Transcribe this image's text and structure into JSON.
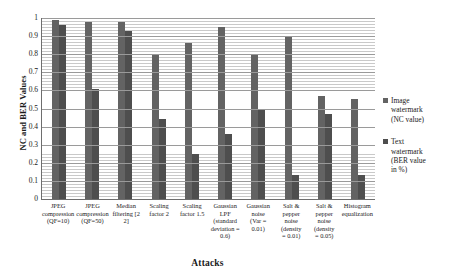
{
  "chart_data": {
    "type": "bar",
    "title": "",
    "xlabel": "Attacks",
    "ylabel": "NC and BER Values",
    "ylim": [
      0,
      1
    ],
    "yticks": [
      "0",
      "0.1",
      "0.2",
      "0.3",
      "0.4",
      "0.5",
      "0.6",
      "0.7",
      "0.8",
      "0.9",
      "1"
    ],
    "grid": true,
    "legend_position": "right",
    "categories": [
      "JPEG compression (QF=10)",
      "JPEG compression (QF=50)",
      "Median filtering [2 2]",
      "Scaling factor 2",
      "Scaling factor 1.5",
      "Gaussian LPF (standard deviation = 0.6)",
      "Gaussian noise (Var = 0.01)",
      "Salt & pepper noise (density = 0.01)",
      "Salt & pepper noise (density = 0.05)",
      "Histogram equalization"
    ],
    "category_lines": [
      [
        "JPEG",
        "compression",
        "(QF=10)"
      ],
      [
        "JPEG",
        "compression",
        "(QF=50)"
      ],
      [
        "Median",
        "filtering [2",
        "2]"
      ],
      [
        "Scaling",
        "factor 2"
      ],
      [
        "Scaling",
        "factor 1.5"
      ],
      [
        "Gaussian",
        "LPF",
        "(standard",
        "deviation =",
        "0.6)"
      ],
      [
        "Gaussian",
        "noise",
        "(Var =",
        "0.01)"
      ],
      [
        "Salt &",
        "pepper",
        "noise",
        "(density",
        "= 0.01)"
      ],
      [
        "Salt &",
        "pepper",
        "noise",
        "(density",
        "= 0.05)"
      ],
      [
        "Histogram",
        "equalization"
      ]
    ],
    "series": [
      {
        "name": "Image watermark (NC value)",
        "name_lines": [
          "Image",
          "watermark",
          "(NC value)"
        ],
        "color": "#636363",
        "values": [
          0.99,
          0.98,
          0.98,
          0.8,
          0.86,
          0.95,
          0.8,
          0.9,
          0.57,
          0.55
        ]
      },
      {
        "name": "Text watermark (BER value in %)",
        "name_lines": [
          "Text",
          "watermark",
          "(BER value",
          "in %)"
        ],
        "color": "#4e4e4e",
        "values": [
          0.96,
          0.61,
          0.93,
          0.44,
          0.25,
          0.36,
          0.5,
          0.13,
          0.47,
          0.13
        ]
      }
    ]
  }
}
